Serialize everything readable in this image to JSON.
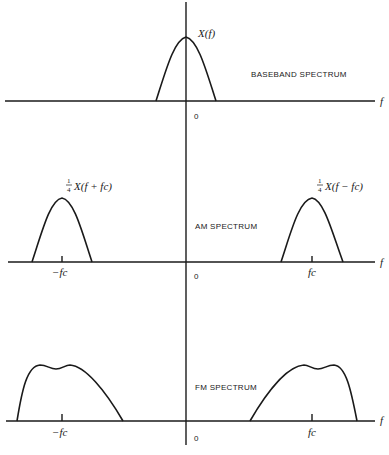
{
  "figure": {
    "axis_label_f": "f",
    "origin_label": "0",
    "panels": [
      {
        "name": "baseband",
        "title": "BASEBAND SPECTRUM",
        "curve_label": "X(f)",
        "tick_labels": []
      },
      {
        "name": "am",
        "title": "AM SPECTRUM",
        "curve_label_left": "X(f + fc)",
        "curve_label_right": "X(f − fc)",
        "scale_numerator": "1",
        "scale_denominator": "4",
        "tick_label_left": "−fc",
        "tick_label_right": "fc"
      },
      {
        "name": "fm",
        "title": "FM SPECTRUM",
        "tick_label_left": "−fc",
        "tick_label_right": "fc"
      }
    ]
  }
}
